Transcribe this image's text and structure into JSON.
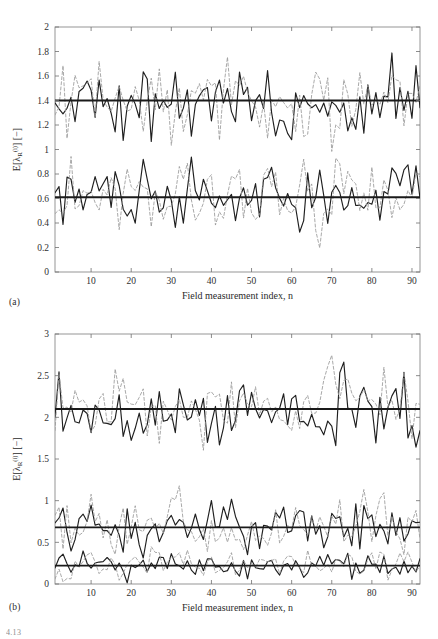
{
  "figure": {
    "type": "multi-panel-line-chart",
    "caption_stub": "4.13",
    "panels": [
      {
        "tag": "(a)",
        "xlabel": "Field measurement index, n",
        "ylabel_plain": "E[λR(i)] [−]",
        "ylabel_parts": {
          "lead": "E[λ",
          "sub": "R",
          "sup": "(i)",
          "tail": "] [−]"
        }
      },
      {
        "tag": "(b)",
        "xlabel": "Field measurement index, n",
        "ylabel_plain": "E[λR(i)] [−]",
        "ylabel_parts": {
          "lead": "E[λ",
          "sub": "R",
          "sup": "(i)",
          "tail": "] [−]"
        }
      }
    ]
  },
  "chart_data": [
    {
      "panel": "(a)",
      "type": "line",
      "title": "",
      "xlabel": "Field measurement index, n",
      "ylabel": "E[λR(i)] [−]",
      "xlim": [
        1,
        92
      ],
      "ylim": [
        0,
        2
      ],
      "xticks": [
        10,
        20,
        30,
        40,
        50,
        60,
        70,
        80,
        90
      ],
      "yticks": [
        0,
        0.2,
        0.4,
        0.6,
        0.8,
        1,
        1.2,
        1.4,
        1.6,
        1.8,
        2
      ],
      "ytick_labels": [
        "0",
        "0.2",
        "0.4",
        "0.6",
        "0.8",
        "1",
        "1.2",
        "1.4",
        "1.6",
        "1.8",
        "2"
      ],
      "grid": false,
      "legend": "none",
      "reference_lines": [
        {
          "value": 1.4,
          "style": "solid",
          "color": "#1a1a1a",
          "width": 1.9
        },
        {
          "value": 0.61,
          "style": "solid",
          "color": "#1a1a1a",
          "width": 1.9
        }
      ],
      "series": [
        {
          "name": "upper-solid",
          "style": "solid",
          "color": "#1f1f1f",
          "width": 1.15,
          "mean": 1.4,
          "amplitude": 0.23,
          "seed": 1207,
          "n": 92
        },
        {
          "name": "upper-dashed",
          "style": "dashed",
          "color": "#9a9a9a",
          "width": 0.85,
          "mean": 1.42,
          "amplitude": 0.25,
          "seed": 3391,
          "n": 92
        },
        {
          "name": "lower-solid",
          "style": "solid",
          "color": "#1f1f1f",
          "width": 1.15,
          "mean": 0.6,
          "amplitude": 0.21,
          "seed": 5573,
          "n": 92
        },
        {
          "name": "lower-dashed",
          "style": "dashed",
          "color": "#9a9a9a",
          "width": 0.85,
          "mean": 0.6,
          "amplitude": 0.23,
          "seed": 7717,
          "n": 92
        }
      ]
    },
    {
      "panel": "(b)",
      "type": "line",
      "title": "",
      "xlabel": "Field measurement index, n",
      "ylabel": "E[λR(i)] [−]",
      "xlim": [
        1,
        92
      ],
      "ylim": [
        0,
        3
      ],
      "xticks": [
        10,
        20,
        30,
        40,
        50,
        60,
        70,
        80,
        90
      ],
      "yticks": [
        0,
        0.5,
        1,
        1.5,
        2,
        2.5,
        3
      ],
      "ytick_labels": [
        "0",
        "0.5",
        "1",
        "1.5",
        "2",
        "2.5",
        "3"
      ],
      "grid": false,
      "legend": "none",
      "reference_lines": [
        {
          "value": 2.1,
          "style": "solid",
          "color": "#1a1a1a",
          "width": 1.9
        },
        {
          "value": 0.68,
          "style": "solid",
          "color": "#1a1a1a",
          "width": 1.9
        },
        {
          "value": 0.22,
          "style": "solid",
          "color": "#1a1a1a",
          "width": 1.9
        }
      ],
      "series": [
        {
          "name": "upper-solid",
          "style": "solid",
          "color": "#1f1f1f",
          "width": 1.15,
          "mean": 2.1,
          "amplitude": 0.33,
          "seed": 2029,
          "n": 92
        },
        {
          "name": "upper-dashed",
          "style": "dashed",
          "color": "#9a9a9a",
          "width": 0.85,
          "mean": 2.16,
          "amplitude": 0.34,
          "seed": 4451,
          "n": 92
        },
        {
          "name": "mid-solid",
          "style": "solid",
          "color": "#1f1f1f",
          "width": 1.15,
          "mean": 0.72,
          "amplitude": 0.25,
          "seed": 6163,
          "n": 92
        },
        {
          "name": "mid-dashed",
          "style": "dashed",
          "color": "#9a9a9a",
          "width": 0.85,
          "mean": 0.7,
          "amplitude": 0.27,
          "seed": 8287,
          "n": 92
        },
        {
          "name": "low-solid",
          "style": "solid",
          "color": "#1f1f1f",
          "width": 1.15,
          "mean": 0.22,
          "amplitude": 0.11,
          "seed": 9931,
          "n": 92
        },
        {
          "name": "low-dashed",
          "style": "dashed",
          "color": "#9a9a9a",
          "width": 0.85,
          "mean": 0.24,
          "amplitude": 0.13,
          "seed": 1613,
          "n": 92
        }
      ]
    }
  ]
}
